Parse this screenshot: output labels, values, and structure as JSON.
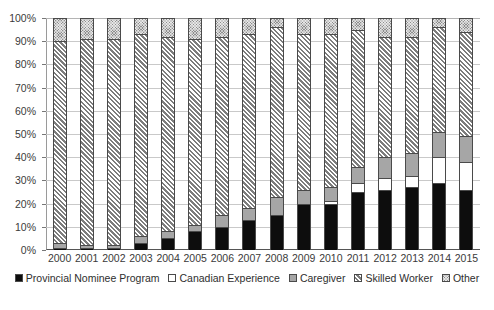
{
  "chart_data": {
    "type": "bar",
    "subtype": "stacked-percent",
    "title": "",
    "xlabel": "",
    "ylabel": "",
    "ylim": [
      0,
      100
    ],
    "ytick_labels": [
      "100%",
      "90%",
      "80%",
      "70%",
      "60%",
      "50%",
      "40%",
      "30%",
      "20%",
      "10%",
      "0%"
    ],
    "ytick_values": [
      100,
      90,
      80,
      70,
      60,
      50,
      40,
      30,
      20,
      10,
      0
    ],
    "grid": true,
    "legend_position": "bottom",
    "categories": [
      "2000",
      "2001",
      "2002",
      "2003",
      "2004",
      "2005",
      "2006",
      "2007",
      "2008",
      "2009",
      "2010",
      "2011",
      "2012",
      "2013",
      "2014",
      "2015"
    ],
    "series": [
      {
        "name": "Provincial Nominee Program",
        "fill": "solid-black",
        "color": "#0d0d0d",
        "values": [
          1,
          1,
          1,
          3,
          5,
          8,
          10,
          13,
          15,
          20,
          20,
          25,
          26,
          27,
          29,
          26
        ]
      },
      {
        "name": "Canadian Experience",
        "fill": "white",
        "color": "#ffffff",
        "values": [
          0,
          0,
          0,
          0,
          0,
          0,
          0,
          0,
          0,
          0,
          1,
          4,
          5,
          5,
          11,
          12
        ]
      },
      {
        "name": "Caregiver",
        "fill": "solid-gray",
        "color": "#a6a6a6",
        "values": [
          2,
          1,
          1,
          3,
          3,
          3,
          5,
          5,
          8,
          6,
          6,
          7,
          9,
          10,
          11,
          11
        ]
      },
      {
        "name": "Skilled Worker",
        "fill": "diagonal-hatch",
        "color": "#d6d6d6",
        "values": [
          87,
          89,
          89,
          87,
          84,
          80,
          77,
          75,
          73,
          67,
          66,
          59,
          52,
          50,
          45,
          45
        ]
      },
      {
        "name": "Other",
        "fill": "crosshatch-dark",
        "color": "#8d8d8d",
        "values": [
          10,
          9,
          9,
          7,
          8,
          9,
          8,
          7,
          4,
          7,
          7,
          5,
          8,
          8,
          4,
          6
        ]
      }
    ]
  },
  "legend": {
    "items": [
      {
        "label": "Provincial Nominee Program",
        "swatch": "solid-black-swatch"
      },
      {
        "label": "Canadian Experience",
        "swatch": "white-swatch"
      },
      {
        "label": "Caregiver",
        "swatch": "solid-gray-swatch"
      },
      {
        "label": "Skilled Worker",
        "swatch": "hatched-swatch"
      },
      {
        "label": "Other",
        "swatch": "crosshatch-swatch"
      }
    ]
  }
}
